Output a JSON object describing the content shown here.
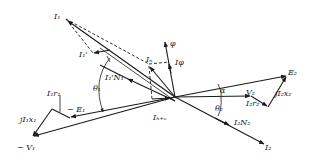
{
  "diagram": {
    "type": "phasor-diagram",
    "origin": [
      175,
      97
    ],
    "phasors": [
      {
        "id": "I1",
        "label": "I",
        "sub": "1",
        "sup": "",
        "from": [
          175,
          97
        ],
        "to": [
          66,
          19
        ],
        "style": "solid"
      },
      {
        "id": "I1prime",
        "label": "I",
        "sub": "1",
        "sup": "'",
        "from": [
          110,
          50
        ],
        "to": [
          93,
          53
        ],
        "style": "solid"
      },
      {
        "id": "I1primeN1",
        "label": "I",
        "sub": "1",
        "sup": "'N",
        "sub2": "1",
        "from": [
          175,
          97
        ],
        "to": [
          130,
          77
        ],
        "style": "solid"
      },
      {
        "id": "phi",
        "label": "φ",
        "from": [
          175,
          97
        ],
        "to": [
          165,
          42
        ],
        "style": "solid"
      },
      {
        "id": "Iphi",
        "label": "I",
        "sub": "φ",
        "from": [
          175,
          97
        ],
        "to": [
          169,
          63
        ],
        "style": "solid"
      },
      {
        "id": "In",
        "label": "I",
        "sub": "n",
        "from": [
          160,
          100
        ],
        "to": [
          149,
          66
        ],
        "style": "solid"
      },
      {
        "id": "Ihe",
        "label": "I",
        "sub": "h+e",
        "from": [
          152,
          99
        ],
        "to": [
          172,
          97
        ],
        "style": "solid"
      },
      {
        "id": "E2",
        "label": "E",
        "sub": "2",
        "from": [
          175,
          97
        ],
        "to": [
          287,
          76
        ],
        "style": "solid"
      },
      {
        "id": "V2",
        "label": "V",
        "sub": "2",
        "from": [
          175,
          97
        ],
        "to": [
          251,
          96
        ],
        "style": "solid"
      },
      {
        "id": "I2r2",
        "label": "I",
        "sub": "2",
        "label2": "r",
        "sub2": "2",
        "from": [
          251,
          96
        ],
        "to": [
          268,
          107
        ],
        "style": "solid"
      },
      {
        "id": "jI2x2",
        "label": "jI",
        "sub": "2",
        "label2": "x",
        "sub2": "2",
        "from": [
          268,
          107
        ],
        "to": [
          287,
          76
        ],
        "style": "solid"
      },
      {
        "id": "I2N2",
        "label": "I",
        "sub": "2",
        "label2": "N",
        "sub2": "2",
        "from": [
          175,
          97
        ],
        "to": [
          230,
          123
        ],
        "style": "solid"
      },
      {
        "id": "I2",
        "label": "I",
        "sub": "2",
        "from": [
          175,
          97
        ],
        "to": [
          265,
          145
        ],
        "style": "solid"
      },
      {
        "id": "minusE1",
        "label": "− E",
        "sub": "1",
        "from": [
          175,
          97
        ],
        "to": [
          70,
          118
        ],
        "style": "solid"
      },
      {
        "id": "I1r1",
        "label": "I",
        "sub": "1",
        "label2": "r",
        "sub2": "1",
        "from": [
          70,
          118
        ],
        "to": [
          52,
          110
        ],
        "style": "solid"
      },
      {
        "id": "jI1x1",
        "label": "jI",
        "sub": "1",
        "label2": "x",
        "sub2": "1",
        "from": [
          52,
          110
        ],
        "to": [
          32,
          137
        ],
        "style": "solid"
      },
      {
        "id": "minusV1",
        "label": "− V",
        "sub": "1",
        "from": [
          175,
          97
        ],
        "to": [
          32,
          137
        ],
        "style": "solid"
      }
    ],
    "dashed_lines": [
      {
        "from": [
          66,
          19
        ],
        "to": [
          149,
          64
        ]
      },
      {
        "from": [
          66,
          19
        ],
        "to": [
          93,
          53
        ]
      },
      {
        "from": [
          149,
          64
        ],
        "to": [
          169,
          62
        ]
      },
      {
        "from": [
          149,
          66
        ],
        "to": [
          152,
          99
        ]
      }
    ],
    "angles": [
      {
        "label": "θ",
        "sub": "1"
      },
      {
        "label": "α"
      },
      {
        "label": "θ",
        "sub": "2"
      }
    ],
    "labels": {
      "I1": "I₁",
      "I1prime": "I₁'",
      "I1primeN1": "I₁'N₁",
      "In": "Iₙ",
      "phi": "φ",
      "Iphi": "Iφ",
      "theta1": "θ₁",
      "Ihe": "Iₕ₊ₑ",
      "E2": "E₂",
      "alpha": "α",
      "V2": "V₂",
      "theta2": "θ₂",
      "I2r2": "I₂r₂",
      "jI2x2": "jI₂x₂",
      "I2N2": "I₂N₂",
      "I2": "I₂",
      "I1r1": "I₁r₁",
      "minusE1": "− E₁",
      "jI1x1": "jI₁x₁",
      "minusV1": "− V₁"
    },
    "colors": {
      "ink": "#1a1a1a",
      "background": "#ffffff"
    }
  }
}
